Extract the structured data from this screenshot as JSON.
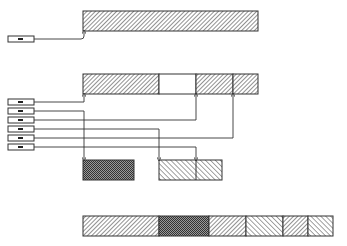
{
  "diagram": {
    "title": "",
    "colors": {
      "stroke": "#333333",
      "hatch": "#555555",
      "background": "#ffffff",
      "crosshatch": "#444444"
    },
    "top_block": {
      "x": 83,
      "y": 11,
      "w": 175,
      "h": 20,
      "pattern": "hatch-right"
    },
    "top_pointer": {
      "box": {
        "x": 8,
        "y": 36,
        "w": 26,
        "h": 6
      },
      "target_x": 84
    },
    "middle_block": {
      "x": 83,
      "y": 74,
      "w": 175,
      "h": 20,
      "segments": [
        {
          "x": 83,
          "w": 76,
          "pattern": "hatch-right"
        },
        {
          "x": 159,
          "w": 37,
          "pattern": "empty"
        },
        {
          "x": 196,
          "w": 37,
          "pattern": "hatch-right"
        },
        {
          "x": 233,
          "w": 25,
          "pattern": "hatch-right"
        }
      ]
    },
    "pointers": [
      {
        "y": 102,
        "target_x": 84,
        "direction": "up"
      },
      {
        "y": 111,
        "target_x": 84,
        "direction": "down"
      },
      {
        "y": 120,
        "target_x": 196,
        "direction": "up"
      },
      {
        "y": 129,
        "target_x": 159,
        "direction": "down"
      },
      {
        "y": 138,
        "target_x": 233,
        "direction": "up"
      },
      {
        "y": 147,
        "target_x": 196,
        "direction": "down"
      }
    ],
    "lower_blocks": [
      {
        "x": 83,
        "y": 160,
        "w": 51,
        "h": 20,
        "pattern": "crosshatch"
      },
      {
        "x": 159,
        "y": 160,
        "w": 63,
        "h": 20,
        "pattern": "hatch-left",
        "dividers": [
          196
        ]
      }
    ],
    "bottom_block": {
      "x": 83,
      "y": 216,
      "w": 250,
      "h": 20,
      "segments": [
        {
          "x": 83,
          "w": 76,
          "pattern": "hatch-right"
        },
        {
          "x": 159,
          "w": 50,
          "pattern": "crosshatch"
        },
        {
          "x": 209,
          "w": 37,
          "pattern": "hatch-right"
        },
        {
          "x": 246,
          "w": 37,
          "pattern": "hatch-left"
        },
        {
          "x": 283,
          "w": 25,
          "pattern": "hatch-right"
        },
        {
          "x": 308,
          "w": 25,
          "pattern": "hatch-left"
        }
      ]
    }
  }
}
